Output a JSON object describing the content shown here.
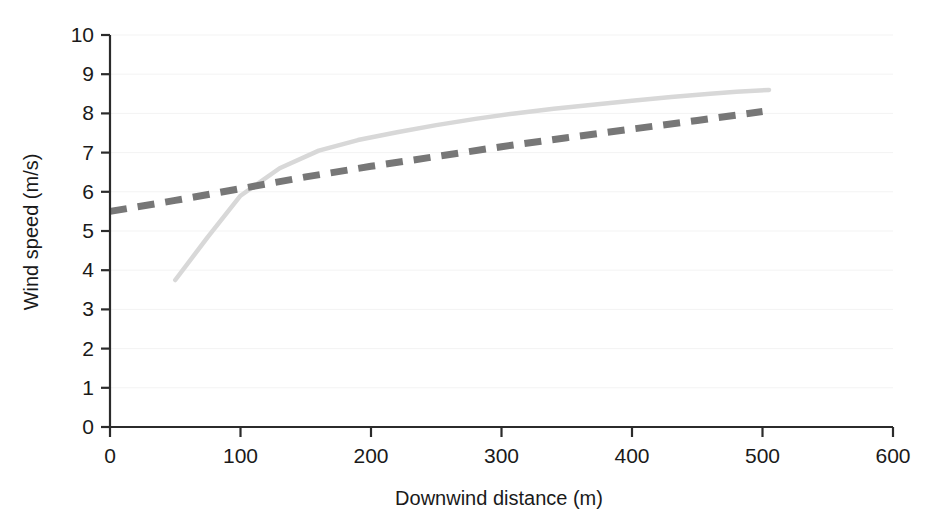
{
  "chart_data": {
    "type": "line",
    "title": "",
    "xlabel": "Downwind distance (m)",
    "ylabel": "Wind speed (m/s)",
    "xlim": [
      0,
      600
    ],
    "ylim": [
      0,
      10
    ],
    "xticks": [
      0,
      100,
      200,
      300,
      400,
      500,
      600
    ],
    "yticks": [
      0,
      1,
      2,
      3,
      4,
      5,
      6,
      7,
      8,
      9,
      10
    ],
    "xtick_labels": [
      "0",
      "100",
      "200",
      "300",
      "400",
      "500",
      "600"
    ],
    "ytick_labels": [
      "0",
      "1",
      "2",
      "3",
      "4",
      "5",
      "6",
      "7",
      "8",
      "9",
      "10"
    ],
    "grid": "faint-horizontal",
    "legend": "none",
    "series": [
      {
        "name": "measured-wind-speed",
        "style": "solid",
        "color": "#d8d8d8",
        "linewidth": 4.5,
        "x": [
          50,
          75,
          100,
          130,
          160,
          190,
          220,
          250,
          280,
          310,
          340,
          370,
          400,
          430,
          460,
          480,
          505
        ],
        "y": [
          3.75,
          4.85,
          5.9,
          6.6,
          7.05,
          7.32,
          7.52,
          7.7,
          7.86,
          8.0,
          8.12,
          8.22,
          8.32,
          8.42,
          8.5,
          8.55,
          8.6
        ]
      },
      {
        "name": "modelled-wind-speed",
        "style": "dashed",
        "color": "#777777",
        "linewidth": 7,
        "dash": "17 11",
        "x": [
          0,
          50,
          100,
          150,
          200,
          250,
          300,
          350,
          400,
          450,
          500
        ],
        "y": [
          5.5,
          5.78,
          6.08,
          6.38,
          6.65,
          6.9,
          7.15,
          7.38,
          7.6,
          7.82,
          8.05
        ]
      }
    ]
  },
  "axes": {
    "x_axis_name": "downwind-distance-axis",
    "y_axis_name": "wind-speed-axis"
  }
}
